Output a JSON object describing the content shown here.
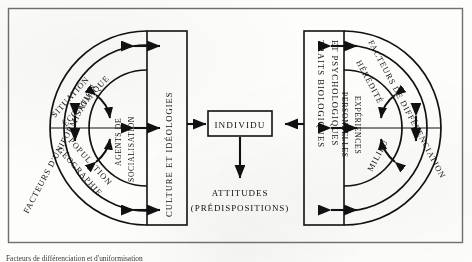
{
  "figure": {
    "frame": {
      "border_color": "#6f6f6f",
      "background": "#fdfdfc"
    },
    "stroke_color": "#111111",
    "caption": "Facteurs de différenciation et d'uniformisation"
  },
  "left_side": {
    "outer_arc_label": "FACTEURS D'UNIFORMISATION",
    "middle_arc_top_label": "SITUATION ÉCONOMIQUE",
    "middle_arc_bottom_label": "GÉOGRAPHIE POPULATION",
    "middle_arc_bottom_label_line1": "GÉOGRAPHIE",
    "middle_arc_bottom_label_line2": "POPULATION",
    "middle_arc_top_line1": "SITUATION",
    "middle_arc_top_line2": "ÉCONOMIQUE",
    "inner_arc_label_line1": "AGENTS DE",
    "inner_arc_label_line2": "SOCIALISATION",
    "box_label": "CULTURE ET IDÉOLOGIES"
  },
  "right_side": {
    "outer_arc_label": "FACTEURS DE DIFFÉRENCIATION",
    "middle_arc_top_label": "HÉRÉDITÉ",
    "middle_arc_bottom_label": "MILIEU",
    "inner_arc_label_line1": "EXPÉRIENCES",
    "inner_arc_label_line2": "PERSONNELLES",
    "box_label_line1": "TRAITS BIOLOGIQUES",
    "box_label_line2": "ET PSYCHOLOGIQUES"
  },
  "center": {
    "individual_label": "INDIVIDU",
    "outcome_label": "ATTITUDES",
    "outcome_sub_label": "(PRÉDISPOSITIONS)"
  }
}
